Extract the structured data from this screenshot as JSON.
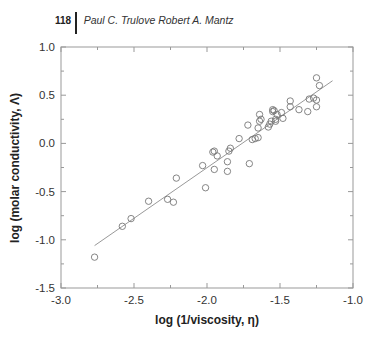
{
  "header": {
    "page_number": "118",
    "authors": "Paul C. Trulove Robert A. Mantz"
  },
  "chart_data": {
    "type": "scatter",
    "title": "",
    "xlabel": "log (1/viscosity, η)",
    "ylabel": "log (molar conductivity, Λ)",
    "xlim": [
      -3.0,
      -1.0
    ],
    "ylim": [
      -1.5,
      1.0
    ],
    "xticks": [
      -3.0,
      -2.5,
      -2.0,
      -1.5,
      -1.0
    ],
    "xtick_labels": [
      "-3.0",
      "-2.5",
      "-2.0",
      "-1.5",
      "-1.0"
    ],
    "yticks": [
      -1.5,
      -1.0,
      -0.5,
      0.0,
      0.5,
      1.0
    ],
    "ytick_labels": [
      "-1.5",
      "-1.0",
      "-0.5",
      "0.0",
      "0.5",
      "1.0"
    ],
    "grid": false,
    "legend": null,
    "marker": "open-circle",
    "points": [
      [
        -2.77,
        -1.18
      ],
      [
        -2.58,
        -0.86
      ],
      [
        -2.52,
        -0.78
      ],
      [
        -2.4,
        -0.6
      ],
      [
        -2.27,
        -0.58
      ],
      [
        -2.23,
        -0.61
      ],
      [
        -2.21,
        -0.36
      ],
      [
        -2.01,
        -0.46
      ],
      [
        -2.03,
        -0.23
      ],
      [
        -1.95,
        -0.27
      ],
      [
        -1.95,
        -0.08
      ],
      [
        -1.96,
        -0.09
      ],
      [
        -1.93,
        -0.13
      ],
      [
        -1.86,
        -0.19
      ],
      [
        -1.85,
        -0.08
      ],
      [
        -1.86,
        -0.29
      ],
      [
        -1.84,
        -0.05
      ],
      [
        -1.78,
        0.05
      ],
      [
        -1.71,
        -0.21
      ],
      [
        -1.69,
        0.04
      ],
      [
        -1.67,
        0.05
      ],
      [
        -1.65,
        0.06
      ],
      [
        -1.72,
        0.19
      ],
      [
        -1.65,
        0.16
      ],
      [
        -1.64,
        0.23
      ],
      [
        -1.64,
        0.3
      ],
      [
        -1.63,
        0.25
      ],
      [
        -1.58,
        0.17
      ],
      [
        -1.57,
        0.2
      ],
      [
        -1.56,
        0.23
      ],
      [
        -1.53,
        0.23
      ],
      [
        -1.53,
        0.25
      ],
      [
        -1.55,
        0.33
      ],
      [
        -1.55,
        0.35
      ],
      [
        -1.54,
        0.34
      ],
      [
        -1.52,
        0.3
      ],
      [
        -1.48,
        0.26
      ],
      [
        -1.49,
        0.32
      ],
      [
        -1.43,
        0.44
      ],
      [
        -1.43,
        0.38
      ],
      [
        -1.37,
        0.35
      ],
      [
        -1.31,
        0.33
      ],
      [
        -1.27,
        0.47
      ],
      [
        -1.25,
        0.45
      ],
      [
        -1.25,
        0.38
      ],
      [
        -1.3,
        0.46
      ],
      [
        -1.25,
        0.68
      ],
      [
        -1.23,
        0.6
      ]
    ],
    "fit_line": {
      "x": [
        -2.77,
        -1.14
      ],
      "y": [
        -1.06,
        0.65
      ]
    }
  },
  "colors": {
    "axis": "#999999",
    "marker": "#777777",
    "fit_line": "#999999",
    "text": "#333333"
  }
}
